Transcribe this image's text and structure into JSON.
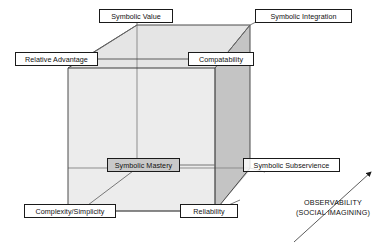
{
  "diagram": {
    "colors": {
      "line": "#5a5a5a",
      "edge_dark": "#3d3d3d",
      "face_top": "#e3e3e3",
      "face_front": "#ebebeb",
      "face_right": "#c2c2c2",
      "box_border": "#1a1a1a",
      "box_fill": "#ffffff",
      "box_fill_shaded": "#c9c9c9",
      "text": "#111111"
    },
    "nodes": [
      {
        "id": "symbolic-value",
        "label": "Symbolic Value",
        "style": "plain",
        "x": 99,
        "y": 9,
        "w": 74,
        "h": 14
      },
      {
        "id": "symbolic-integration",
        "label": "Symbolic Integration",
        "style": "plain",
        "x": 255,
        "y": 9,
        "w": 97,
        "h": 14
      },
      {
        "id": "relative-advantage",
        "label": "Relative Advantage",
        "style": "plain",
        "x": 15,
        "y": 52,
        "w": 83,
        "h": 14
      },
      {
        "id": "compatability",
        "label": "Compatability",
        "style": "plain",
        "x": 188,
        "y": 52,
        "w": 66,
        "h": 14
      },
      {
        "id": "symbolic-mastery",
        "label": "Symbolic Mastery",
        "style": "shaded",
        "x": 107,
        "y": 158,
        "w": 73,
        "h": 14
      },
      {
        "id": "symbolic-subservience",
        "label": "Symbolic Subservience",
        "style": "translucent",
        "x": 243,
        "y": 158,
        "w": 97,
        "h": 14
      },
      {
        "id": "complexity-simplicity",
        "label": "Complexity/Simplicity",
        "style": "plain",
        "x": 24,
        "y": 204,
        "w": 92,
        "h": 14
      },
      {
        "id": "reliability",
        "label": "Reliability",
        "style": "plain",
        "x": 180,
        "y": 204,
        "w": 58,
        "h": 14
      }
    ],
    "axis": {
      "line1": "OBSERVABILITY",
      "line2": "(SOCIAL IMAGINING)"
    }
  }
}
